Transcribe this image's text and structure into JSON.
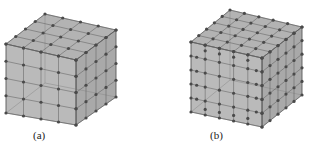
{
  "figure": {
    "panels": [
      {
        "id": "a",
        "label": "(a)",
        "description": "Cube mesh with uniform 4x4x4 subdivision and nodes",
        "subdivisions": 4,
        "fill_color": "#9a9a9a",
        "edge_color": "#5a5a5a",
        "node_color": "#4a4a4a"
      },
      {
        "id": "b",
        "label": "(b)",
        "description": "Cube mesh with refined subdivision (denser nodes near edges)",
        "subdivisions": 5,
        "fill_color": "#9a9a9a",
        "edge_color": "#5a5a5a",
        "node_color": "#4a4a4a"
      }
    ]
  }
}
